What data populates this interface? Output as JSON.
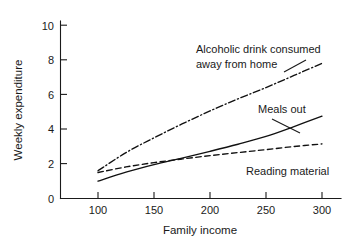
{
  "chart_data": {
    "type": "line",
    "title": "",
    "xlabel": "Family income",
    "ylabel": "Weekly expenditure",
    "xlim": [
      75,
      320
    ],
    "ylim": [
      0,
      10.6
    ],
    "xticks": [
      100,
      150,
      200,
      250,
      300
    ],
    "yticks": [
      0,
      2,
      4,
      6,
      8,
      10
    ],
    "grid": false,
    "legend_position": "inline-annotations",
    "x": [
      100,
      125,
      150,
      175,
      200,
      225,
      250,
      275,
      300
    ],
    "series": [
      {
        "name": "Alcoholic drink consumed away from home",
        "style": "dash-dot",
        "values": [
          1.6,
          2.65,
          3.5,
          4.3,
          5.05,
          5.75,
          6.4,
          7.1,
          7.8
        ]
      },
      {
        "name": "Meals out",
        "style": "solid",
        "values": [
          1.0,
          1.52,
          1.95,
          2.33,
          2.72,
          3.13,
          3.58,
          4.15,
          4.75
        ]
      },
      {
        "name": "Reading material",
        "style": "dashed",
        "values": [
          1.5,
          1.82,
          2.07,
          2.28,
          2.47,
          2.65,
          2.82,
          3.0,
          3.15
        ]
      }
    ],
    "annotations": [
      {
        "id": "alcohol",
        "line1": "Alcoholic drink consumed",
        "line2": "away from home"
      },
      {
        "id": "meals",
        "line1": "Meals out",
        "line2": ""
      },
      {
        "id": "reading",
        "line1": "Reading material",
        "line2": ""
      }
    ]
  },
  "ticks": {
    "y": {
      "t0": "0",
      "t1": "2",
      "t2": "4",
      "t3": "6",
      "t4": "8",
      "t5": "10"
    },
    "x": {
      "t0": "100",
      "t1": "150",
      "t2": "200",
      "t3": "250",
      "t4": "300"
    }
  },
  "labels": {
    "y_axis_title": "Weekly expenditure",
    "x_axis_title": "Family income"
  },
  "annotations": {
    "alcohol_line1": "Alcoholic drink consumed",
    "alcohol_line2": "away from home",
    "meals": "Meals out",
    "reading": "Reading material"
  },
  "colors": {
    "ink": "#1a1a1a",
    "background": "#ffffff",
    "series": "#111111"
  }
}
